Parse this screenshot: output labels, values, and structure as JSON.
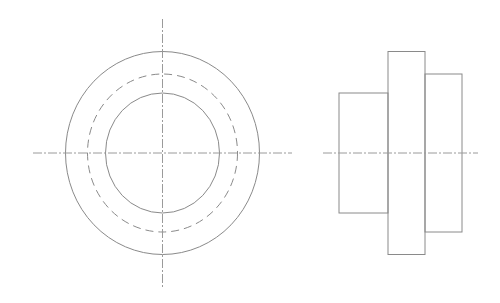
{
  "drawing": {
    "type": "orthographic-projection",
    "colors": {
      "line": "#8a8a8a",
      "centerline": "#9a9a9a",
      "background": "#ffffff"
    },
    "front_view": {
      "center": [
        162.5,
        153
      ],
      "outer_circle": {
        "rx": 97,
        "ry": 101.5,
        "style": "solid"
      },
      "hidden_circle": {
        "rx": 75,
        "ry": 79,
        "style": "dashed"
      },
      "inner_circle": {
        "rx": 57,
        "ry": 60,
        "style": "solid"
      },
      "horizontal_centerline": {
        "x1": 33,
        "x2": 292,
        "y": 153
      },
      "vertical_centerline": {
        "y1": 19,
        "y2": 287,
        "x": 162.5
      }
    },
    "side_view": {
      "left_hub": {
        "x": 339,
        "y": 93,
        "width": 49,
        "height": 120
      },
      "flange": {
        "x": 388,
        "y": 51.5,
        "width": 37,
        "height": 203
      },
      "right_hub": {
        "x": 425,
        "y": 74,
        "width": 37,
        "height": 158
      },
      "centerline": {
        "x1": 323,
        "x2": 478,
        "y": 153
      }
    }
  }
}
